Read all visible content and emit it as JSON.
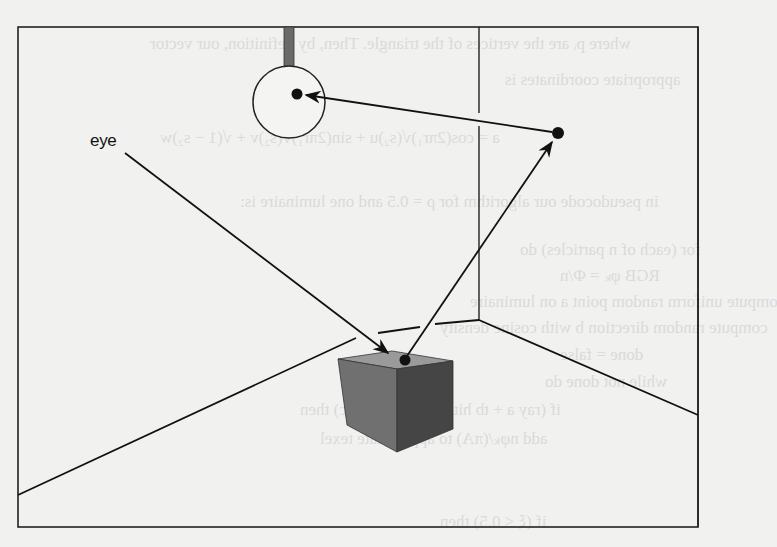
{
  "figure": {
    "type": "ray-path illustration",
    "labels": {
      "eye": "eye"
    },
    "elements": [
      {
        "name": "room-frame",
        "kind": "rectangle"
      },
      {
        "name": "light-fixture",
        "kind": "ceiling-rod-with-spherical-luminaire"
      },
      {
        "name": "back-wall-corner",
        "kind": "vertical-edge"
      },
      {
        "name": "floor-edges",
        "kind": "lines"
      },
      {
        "name": "cube",
        "kind": "shaded-box"
      },
      {
        "name": "wall-point",
        "kind": "dot"
      },
      {
        "name": "eye-ray",
        "kind": "arrow",
        "from": "eye",
        "to": "cube-top"
      },
      {
        "name": "cube-to-wall-ray",
        "kind": "arrow",
        "from": "cube-top",
        "to": "wall-point"
      },
      {
        "name": "wall-to-light-ray",
        "kind": "arrow",
        "from": "wall-point",
        "to": "light-center"
      }
    ],
    "colors": {
      "paper": "#f1f1f0",
      "ink": "#1a1a1a",
      "rod": "#6a6a6a",
      "cube_top": "#9a9a9a",
      "cube_left": "#6e6e6e",
      "cube_right": "#444444"
    }
  },
  "bleed_through_text": {
    "lines": [
      "where pᵢ are the vertices of the triangle. Then, by definition, our vector",
      "appropriate coordinates is",
      "a = cos(2πr₁)√(s₂)u + sin(2πr₁)√(s₂)v + √(1 − s₂)w",
      "in pseudocode our algorithm for ρ = 0.5 and one luminaire is:",
      "for (each of n particles) do",
      "RGB φₖ = Φ/n",
      "compute uniform random point a on luminaire",
      "compute random direction b with cosine density",
      "done = false",
      "while not done do",
      "if (ray a + tb hits at some point c) then",
      "add nφₖ/(πA) to appropriate texel",
      "if (ξ < 0.5) then"
    ]
  }
}
